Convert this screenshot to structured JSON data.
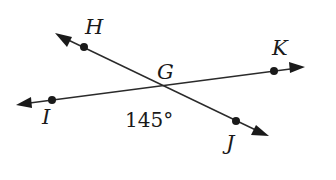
{
  "diagram": {
    "type": "intersecting-lines",
    "intersection_point": "G",
    "lines": [
      {
        "name": "line-HJ",
        "through": [
          "H",
          "G",
          "J"
        ]
      },
      {
        "name": "line-IK",
        "through": [
          "I",
          "G",
          "K"
        ]
      }
    ],
    "points": {
      "H": "H",
      "G": "G",
      "K": "K",
      "I": "I",
      "J": "J"
    },
    "angle_label": "145°",
    "angle_between": [
      "I",
      "G",
      "J"
    ]
  }
}
